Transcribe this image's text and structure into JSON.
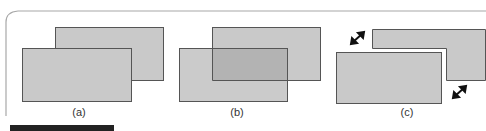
{
  "figure": {
    "panels": [
      {
        "id": "a",
        "label": "(a)",
        "description": "two overlapping opaque rectangles, front occludes back"
      },
      {
        "id": "b",
        "label": "(b)",
        "description": "two overlapping translucent rectangles, overlap region darker"
      },
      {
        "id": "c",
        "label": "(c)",
        "description": "two rectangles separated, with diagonal double-headed arrows indicating separation"
      }
    ],
    "colors": {
      "fill": "#c9c9c9",
      "fill_overlap": "#b3b3b3",
      "stroke": "#555555",
      "frame": "#a8a8a8",
      "bottom_bar": "#222222"
    },
    "icons": [
      "double-arrow-icon",
      "double-arrow-icon"
    ]
  }
}
